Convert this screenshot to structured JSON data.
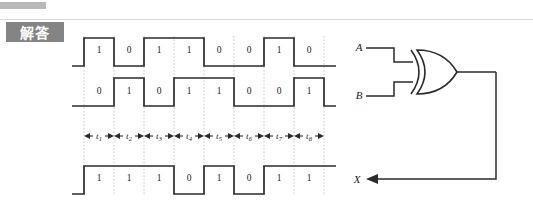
{
  "header": {
    "answer_label": "解答"
  },
  "timing_diagram": {
    "signals": [
      {
        "name": "A",
        "values": [
          "1",
          "0",
          "1",
          "1",
          "0",
          "0",
          "1",
          "0"
        ]
      },
      {
        "name": "B",
        "values": [
          "0",
          "1",
          "0",
          "1",
          "1",
          "0",
          "0",
          "1"
        ]
      },
      {
        "name": "X",
        "values": [
          "1",
          "1",
          "1",
          "0",
          "1",
          "0",
          "1",
          "1"
        ]
      }
    ],
    "time_slots": [
      "t1",
      "t2",
      "t3",
      "t4",
      "t5",
      "t6",
      "t7",
      "t8"
    ],
    "time_slot_labels": [
      "t",
      "t",
      "t",
      "t",
      "t",
      "t",
      "t",
      "t"
    ],
    "time_slot_subscripts": [
      "1",
      "2",
      "3",
      "4",
      "5",
      "6",
      "7",
      "8"
    ]
  },
  "circuit": {
    "gate_type": "xor-gate",
    "input_a_label": "A",
    "input_b_label": "B",
    "output_label": "X"
  },
  "colors": {
    "ink": "#2b2b2b",
    "grid": "#bdbdbd",
    "chip_bg": "#848484",
    "rule": "#d9d9d9"
  }
}
